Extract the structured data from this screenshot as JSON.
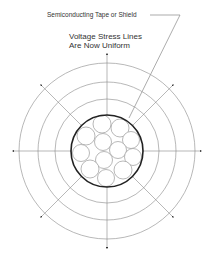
{
  "diagram": {
    "callout_label": "Semiconducting Tape or Shield",
    "title_line1": "Voltage Stress Lines",
    "title_line2": "Are Now Uniform",
    "center": [
      107,
      151
    ],
    "ring_radii": [
      52,
      69,
      88
    ],
    "shield_radius": 35,
    "strand_count": 12,
    "axis_arrows": [
      "up",
      "down",
      "left",
      "right",
      "up-left",
      "up-right",
      "down-left",
      "down-right"
    ],
    "colors": {
      "lines": "#888888",
      "shield": "#222222",
      "text": "#333333"
    }
  }
}
